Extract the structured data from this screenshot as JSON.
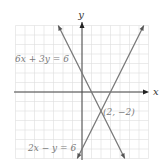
{
  "chart_data": {
    "type": "line",
    "title": "",
    "xlabel": "x",
    "ylabel": "y",
    "xlim": [
      -7,
      7
    ],
    "ylim": [
      -7,
      7
    ],
    "grid": true,
    "series": [
      {
        "name": "6x + 3y = 6",
        "equation": "y = 2 - 2x",
        "points": [
          [
            -2.5,
            7
          ],
          [
            4.5,
            -7
          ]
        ]
      },
      {
        "name": "2x − y = 6",
        "equation": "y = 2x - 6",
        "points": [
          [
            -0.5,
            -7
          ],
          [
            6.5,
            7
          ]
        ]
      }
    ],
    "annotations": [
      {
        "text": "(2, −2)",
        "x": 2,
        "y": -2
      }
    ]
  },
  "labels": {
    "y_axis": "y",
    "x_axis": "x",
    "line1": "6x + 3y = 6",
    "line2": "2x − y = 6",
    "point": "(2, −2)"
  },
  "colors": {
    "grid": "#dddddd",
    "axis": "#444444",
    "line": "#777777",
    "text": "#7a7a7a"
  }
}
